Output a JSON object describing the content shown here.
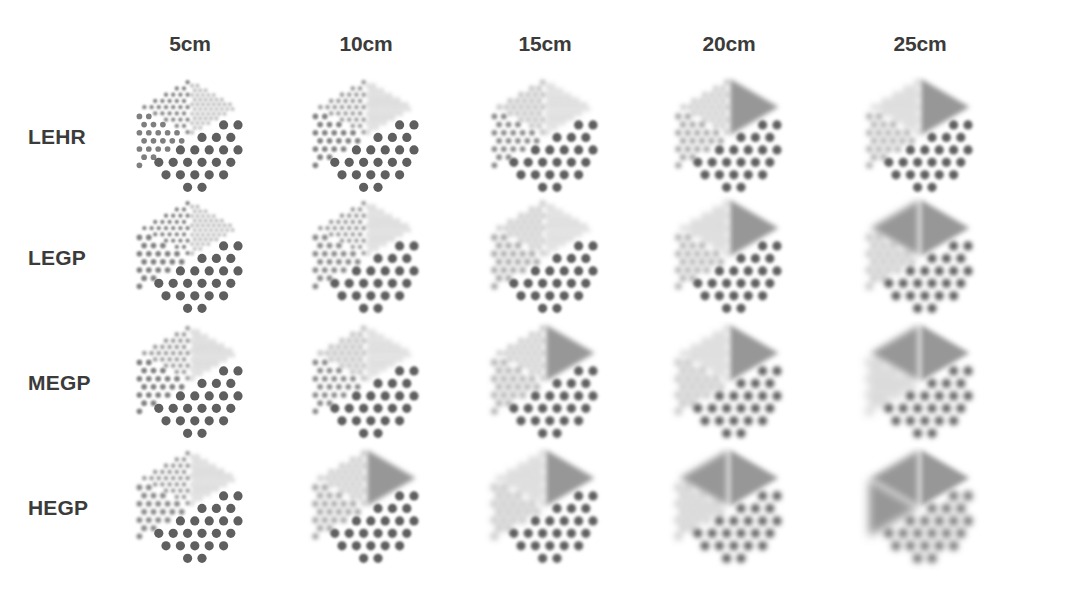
{
  "figure": {
    "background_color": "#ffffff",
    "text_color": "#3b3b3b"
  },
  "columns": [
    {
      "id": "d5",
      "label": "5cm",
      "distance_cm": 5,
      "center_x": 190
    },
    {
      "id": "d10",
      "label": "10cm",
      "distance_cm": 10,
      "center_x": 366
    },
    {
      "id": "d15",
      "label": "15cm",
      "distance_cm": 15,
      "center_x": 545
    },
    {
      "id": "d20",
      "label": "20cm",
      "distance_cm": 20,
      "center_x": 729
    },
    {
      "id": "d25",
      "label": "25cm",
      "distance_cm": 25,
      "center_x": 920
    }
  ],
  "rows": [
    {
      "id": "lehr",
      "label": "LEHR",
      "center_y": 137
    },
    {
      "id": "legp",
      "label": "LEGP",
      "center_y": 258
    },
    {
      "id": "megp",
      "label": "MEGP",
      "center_y": 383
    },
    {
      "id": "hegp",
      "label": "HEGP",
      "center_y": 508
    }
  ],
  "phantom": {
    "description": "Hexagonal resolution phantom divided into four sectors of differing hole size and spacing",
    "sectors": [
      {
        "name": "top-wedge",
        "hole_size": "smallest",
        "relative_rod_diameter": 0.32
      },
      {
        "name": "upper-left-wedge",
        "hole_size": "small",
        "relative_rod_diameter": 0.46
      },
      {
        "name": "lower-left-wedge",
        "hole_size": "medium",
        "relative_rod_diameter": 0.6
      },
      {
        "name": "right-region",
        "hole_size": "largest",
        "relative_rod_diameter": 1.0
      }
    ],
    "dot_color": "#565656",
    "faint_dot_color": "#8e8e8e"
  },
  "chart_data": {
    "type": "heatmap",
    "xlabel": "Source distance",
    "ylabel": "Collimator type",
    "categories": [
      "5cm",
      "10cm",
      "15cm",
      "20cm",
      "25cm"
    ],
    "row_categories": [
      "LEHR",
      "LEGP",
      "MEGP",
      "HEGP"
    ],
    "value_meaning": "Image blur (FWHM) level, 0 = sharp resolved rods, 1 = fully blurred uniform region",
    "series": [
      {
        "name": "LEHR",
        "values": [
          0.1,
          0.22,
          0.36,
          0.5,
          0.62
        ]
      },
      {
        "name": "LEGP",
        "values": [
          0.16,
          0.3,
          0.46,
          0.62,
          0.76
        ]
      },
      {
        "name": "MEGP",
        "values": [
          0.22,
          0.4,
          0.58,
          0.74,
          0.86
        ]
      },
      {
        "name": "HEGP",
        "values": [
          0.3,
          0.52,
          0.72,
          0.88,
          0.97
        ]
      }
    ],
    "sector_blur": [
      {
        "row": "LEHR",
        "cells": [
          {
            "col": "5cm",
            "blur": [
              0.55,
              0.22,
              0.12,
              0.04
            ]
          },
          {
            "col": "10cm",
            "blur": [
              0.78,
              0.38,
              0.22,
              0.08
            ]
          },
          {
            "col": "15cm",
            "blur": [
              0.92,
              0.56,
              0.34,
              0.12
            ]
          },
          {
            "col": "20cm",
            "blur": [
              1.0,
              0.74,
              0.48,
              0.17
            ]
          },
          {
            "col": "25cm",
            "blur": [
              1.0,
              0.88,
              0.6,
              0.22
            ]
          }
        ]
      },
      {
        "row": "LEGP",
        "cells": [
          {
            "col": "5cm",
            "blur": [
              0.62,
              0.28,
              0.16,
              0.05
            ]
          },
          {
            "col": "10cm",
            "blur": [
              0.85,
              0.46,
              0.28,
              0.1
            ]
          },
          {
            "col": "15cm",
            "blur": [
              0.97,
              0.66,
              0.42,
              0.15
            ]
          },
          {
            "col": "20cm",
            "blur": [
              1.0,
              0.86,
              0.58,
              0.21
            ]
          },
          {
            "col": "25cm",
            "blur": [
              1.0,
              1.0,
              0.74,
              0.28
            ]
          }
        ]
      },
      {
        "row": "MEGP",
        "cells": [
          {
            "col": "5cm",
            "blur": [
              0.7,
              0.34,
              0.2,
              0.06
            ]
          },
          {
            "col": "10cm",
            "blur": [
              0.92,
              0.56,
              0.34,
              0.12
            ]
          },
          {
            "col": "15cm",
            "blur": [
              1.0,
              0.78,
              0.52,
              0.19
            ]
          },
          {
            "col": "20cm",
            "blur": [
              1.0,
              0.96,
              0.7,
              0.27
            ]
          },
          {
            "col": "25cm",
            "blur": [
              1.0,
              1.0,
              0.88,
              0.36
            ]
          }
        ]
      },
      {
        "row": "HEGP",
        "cells": [
          {
            "col": "5cm",
            "blur": [
              0.78,
              0.42,
              0.25,
              0.08
            ]
          },
          {
            "col": "10cm",
            "blur": [
              1.0,
              0.68,
              0.42,
              0.15
            ]
          },
          {
            "col": "15cm",
            "blur": [
              1.0,
              0.92,
              0.64,
              0.24
            ]
          },
          {
            "col": "20cm",
            "blur": [
              1.0,
              1.0,
              0.84,
              0.34
            ]
          },
          {
            "col": "25cm",
            "blur": [
              1.0,
              1.0,
              1.0,
              0.46
            ]
          }
        ]
      }
    ],
    "legend": [],
    "grid": false
  }
}
